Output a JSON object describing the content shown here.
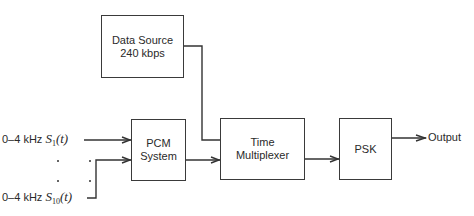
{
  "blocks": {
    "data_source": {
      "line1": "Data Source",
      "line2": "240 kbps"
    },
    "pcm": {
      "line1": "PCM",
      "line2": "System"
    },
    "mux": {
      "line1": "Time",
      "line2": "Multiplexer"
    },
    "psk": {
      "line1": "PSK"
    }
  },
  "inputs": [
    {
      "band": "0–4 kHz",
      "symbol": "S",
      "subscript": "1",
      "arg": "(t)"
    },
    {
      "band": "0–4 kHz",
      "symbol": "S",
      "subscript": "10",
      "arg": "(t)"
    }
  ],
  "output_label": "Output"
}
